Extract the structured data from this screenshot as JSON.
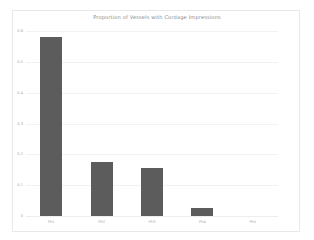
{
  "chart_data": {
    "type": "bar",
    "title": "Proportion of Vessels with Cordage Impressions",
    "xlabel": "",
    "ylabel": "",
    "categories": [
      "Ph1",
      "Ph2",
      "Ph3",
      "Ph4",
      "Ph5"
    ],
    "values": [
      0.58,
      0.175,
      0.155,
      0.027,
      0.0
    ],
    "ylim": [
      0,
      0.6
    ],
    "yticks": [
      0,
      0.1,
      0.2,
      0.3,
      0.4,
      0.5,
      0.6
    ],
    "ytick_labels": [
      "0",
      "0.1",
      "0.2",
      "0.3",
      "0.4",
      "0.5",
      "0.6"
    ],
    "grid": true,
    "legend": false,
    "bar_color": "#5c5c5c",
    "grid_color": "#f2f2f2",
    "background_color": "#ffffff",
    "frame_color": "#e8e8e8",
    "text_color": "#a8a8a8",
    "title_color": "#8a8a8a"
  }
}
